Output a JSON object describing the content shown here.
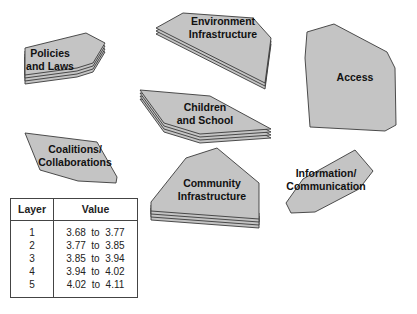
{
  "diagram": {
    "fill_color": "#c4c4c4",
    "stroke_color": "#3a3a3a",
    "shapes": [
      {
        "id": "policies",
        "label_line1": "Policies",
        "label_line2": "and Laws",
        "layers": 4
      },
      {
        "id": "environment",
        "label_line1": "Environment",
        "label_line2": "Infrastructure",
        "layers": 3
      },
      {
        "id": "access",
        "label_line1": "Access",
        "label_line2": "",
        "layers": 1
      },
      {
        "id": "children",
        "label_line1": "Children",
        "label_line2": "and School",
        "layers": 4
      },
      {
        "id": "coalitions",
        "label_line1": "Coalitions/",
        "label_line2": "Collaborations",
        "layers": 1
      },
      {
        "id": "community",
        "label_line1": "Community",
        "label_line2": "Infrastructure",
        "layers": 4
      },
      {
        "id": "information",
        "label_line1": "Information/",
        "label_line2": "Communication",
        "layers": 1
      }
    ]
  },
  "legend": {
    "headers": {
      "layer": "Layer",
      "value": "Value"
    },
    "rows": [
      {
        "layer": "1",
        "value": "3.68  to  3.77"
      },
      {
        "layer": "2",
        "value": "3.77  to  3.85"
      },
      {
        "layer": "3",
        "value": "3.85  to  3.94"
      },
      {
        "layer": "4",
        "value": "3.94  to  4.02"
      },
      {
        "layer": "5",
        "value": "4.02  to  4.11"
      }
    ]
  }
}
